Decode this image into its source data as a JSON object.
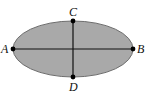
{
  "diagram": {
    "type": "ellipse-with-axes",
    "colors": {
      "fill": "#a9a9a9",
      "stroke": "#6e6e6e",
      "axis": "#111111",
      "point": "#000000",
      "background": "#ffffff"
    },
    "ellipse": {
      "cx": 73,
      "cy": 49,
      "rx": 60,
      "ry": 28
    },
    "segments": [
      {
        "name": "major-axis",
        "from": "A",
        "to": "B"
      },
      {
        "name": "minor-axis",
        "from": "C",
        "to": "D"
      }
    ],
    "points": [
      {
        "id": "A",
        "label": "A",
        "x": 13,
        "y": 49
      },
      {
        "id": "B",
        "label": "B",
        "x": 133,
        "y": 49
      },
      {
        "id": "C",
        "label": "C",
        "x": 73,
        "y": 21
      },
      {
        "id": "D",
        "label": "D",
        "x": 73,
        "y": 77
      }
    ]
  }
}
